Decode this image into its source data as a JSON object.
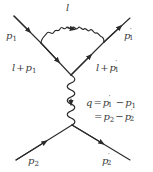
{
  "diagram": {
    "type": "feynman",
    "colors": {
      "line": "#2a2a2a",
      "text": "#3a3a3a",
      "background": "#ffffff"
    },
    "labels": {
      "loop_photon": "l",
      "incoming_1": {
        "base": "p",
        "sub": "1"
      },
      "outgoing_1": {
        "base": "p",
        "sub": "1",
        "prime": "′"
      },
      "internal_in": {
        "prefix": "l",
        "op": "+",
        "base": "p",
        "sub": "1"
      },
      "internal_out": {
        "prefix": "l",
        "op": "+",
        "base": "p",
        "sub": "1",
        "prime": "′"
      },
      "q_line1": {
        "lhs": "q",
        "eq": "=",
        "a_base": "p",
        "a_sub": "1",
        "a_prime": "′",
        "minus": "−",
        "b_base": "p",
        "b_sub": "1"
      },
      "q_line2": {
        "eq": "=",
        "a_base": "p",
        "a_sub": "2",
        "minus": "−",
        "b_base": "p",
        "b_sub": "2",
        "b_prime": "′"
      },
      "incoming_2": {
        "base": "p",
        "sub": "2"
      },
      "outgoing_2": {
        "base": "p",
        "sub": "2",
        "prime": "′"
      }
    },
    "nodes": {
      "p1_start": [
        14,
        16
      ],
      "loop_left": [
        41,
        43
      ],
      "upper_vertex": [
        71,
        75
      ],
      "loop_right": [
        104,
        42
      ],
      "p1p_end": [
        130,
        18
      ],
      "lower_vertex": [
        72,
        125
      ],
      "p2_start": [
        16,
        160
      ],
      "p2p_end": [
        130,
        160
      ]
    },
    "edges": [
      {
        "name": "fermion-p1",
        "from": "p1_start",
        "to": "loop_left",
        "kind": "fermion"
      },
      {
        "name": "fermion-l-plus-p1",
        "from": "loop_left",
        "to": "upper_vertex",
        "kind": "fermion"
      },
      {
        "name": "fermion-l-plus-p1prime",
        "from": "upper_vertex",
        "to": "loop_right",
        "kind": "fermion"
      },
      {
        "name": "fermion-p1prime",
        "from": "loop_right",
        "to": "p1p_end",
        "kind": "fermion"
      },
      {
        "name": "photon-loop-l",
        "from": "loop_left",
        "to": "loop_right",
        "kind": "photon"
      },
      {
        "name": "photon-q",
        "from": "upper_vertex",
        "to": "lower_vertex",
        "kind": "photon"
      },
      {
        "name": "fermion-p2",
        "from": "p2_start",
        "to": "lower_vertex",
        "kind": "fermion"
      },
      {
        "name": "fermion-p2prime",
        "from": "lower_vertex",
        "to": "p2p_end",
        "kind": "fermion"
      }
    ]
  }
}
